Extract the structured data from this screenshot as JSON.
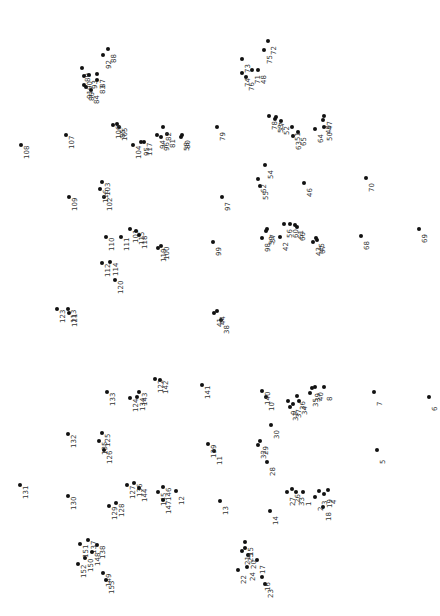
{
  "puzzle": {
    "title": "Connect the dots",
    "dot_color": "#111111",
    "label_color": "#333333",
    "label_rotation_deg": -90,
    "dots": [
      {
        "n": 1,
        "x": 303,
        "y": 492
      },
      {
        "n": 2,
        "x": 315,
        "y": 497
      },
      {
        "n": 3,
        "x": 319,
        "y": 491
      },
      {
        "n": 4,
        "x": 328,
        "y": 490
      },
      {
        "n": 5,
        "x": 377,
        "y": 450
      },
      {
        "n": 6,
        "x": 429,
        "y": 397
      },
      {
        "n": 7,
        "x": 374,
        "y": 392
      },
      {
        "n": 8,
        "x": 324,
        "y": 387
      },
      {
        "n": 9,
        "x": 288,
        "y": 401
      },
      {
        "n": 10,
        "x": 266,
        "y": 397
      },
      {
        "n": 11,
        "x": 214,
        "y": 451
      },
      {
        "n": 12,
        "x": 176,
        "y": 491
      },
      {
        "n": 13,
        "x": 220,
        "y": 501
      },
      {
        "n": 14,
        "x": 270,
        "y": 511
      },
      {
        "n": 15,
        "x": 245,
        "y": 542
      },
      {
        "n": 16,
        "x": 262,
        "y": 577
      },
      {
        "n": 17,
        "x": 257,
        "y": 560
      },
      {
        "n": 18,
        "x": 323,
        "y": 507
      },
      {
        "n": 19,
        "x": 324,
        "y": 494
      },
      {
        "n": 20,
        "x": 248,
        "y": 555
      },
      {
        "n": 21,
        "x": 242,
        "y": 551
      },
      {
        "n": 22,
        "x": 238,
        "y": 570
      },
      {
        "n": 23,
        "x": 265,
        "y": 584
      },
      {
        "n": 24,
        "x": 247,
        "y": 567
      },
      {
        "n": 25,
        "x": 245,
        "y": 548
      },
      {
        "n": 26,
        "x": 292,
        "y": 489
      },
      {
        "n": 27,
        "x": 287,
        "y": 492
      },
      {
        "n": 28,
        "x": 267,
        "y": 462
      },
      {
        "n": 29,
        "x": 260,
        "y": 441
      },
      {
        "n": 30,
        "x": 271,
        "y": 425
      },
      {
        "n": 31,
        "x": 290,
        "y": 407
      },
      {
        "n": 32,
        "x": 258,
        "y": 445
      },
      {
        "n": 33,
        "x": 296,
        "y": 492
      },
      {
        "n": 34,
        "x": 299,
        "y": 401
      },
      {
        "n": 35,
        "x": 310,
        "y": 393
      },
      {
        "n": 36,
        "x": 297,
        "y": 396
      },
      {
        "n": 37,
        "x": 293,
        "y": 404
      },
      {
        "n": 38,
        "x": 221,
        "y": 320
      },
      {
        "n": 39,
        "x": 312,
        "y": 388
      },
      {
        "n": 40,
        "x": 315,
        "y": 387
      },
      {
        "n": 41,
        "x": 214,
        "y": 313
      },
      {
        "n": 42,
        "x": 280,
        "y": 237
      },
      {
        "n": 43,
        "x": 313,
        "y": 242
      },
      {
        "n": 44,
        "x": 217,
        "y": 311
      },
      {
        "n": 45,
        "x": 316,
        "y": 238
      },
      {
        "n": 46,
        "x": 304,
        "y": 183
      },
      {
        "n": 47,
        "x": 324,
        "y": 116
      },
      {
        "n": 48,
        "x": 258,
        "y": 70
      },
      {
        "n": 49,
        "x": 323,
        "y": 120
      },
      {
        "n": 50,
        "x": 324,
        "y": 127
      },
      {
        "n": 51,
        "x": 292,
        "y": 127
      },
      {
        "n": 52,
        "x": 281,
        "y": 121
      },
      {
        "n": 53,
        "x": 275,
        "y": 119
      },
      {
        "n": 54,
        "x": 265,
        "y": 165
      },
      {
        "n": 55,
        "x": 260,
        "y": 186
      },
      {
        "n": 56,
        "x": 284,
        "y": 224
      },
      {
        "n": 57,
        "x": 267,
        "y": 229
      },
      {
        "n": 58,
        "x": 181,
        "y": 137
      },
      {
        "n": 59,
        "x": 266,
        "y": 231
      },
      {
        "n": 60,
        "x": 290,
        "y": 224
      },
      {
        "n": 61,
        "x": 295,
        "y": 225
      },
      {
        "n": 62,
        "x": 258,
        "y": 179
      },
      {
        "n": 63,
        "x": 293,
        "y": 136
      },
      {
        "n": 64,
        "x": 315,
        "y": 129
      },
      {
        "n": 65,
        "x": 298,
        "y": 132
      },
      {
        "n": 66,
        "x": 297,
        "y": 227
      },
      {
        "n": 67,
        "x": 317,
        "y": 240
      },
      {
        "n": 68,
        "x": 361,
        "y": 236
      },
      {
        "n": 69,
        "x": 419,
        "y": 229
      },
      {
        "n": 70,
        "x": 366,
        "y": 178
      },
      {
        "n": 71,
        "x": 252,
        "y": 70
      },
      {
        "n": 72,
        "x": 268,
        "y": 41
      },
      {
        "n": 73,
        "x": 242,
        "y": 59
      },
      {
        "n": 74,
        "x": 242,
        "y": 73
      },
      {
        "n": 75,
        "x": 264,
        "y": 50
      },
      {
        "n": 76,
        "x": 246,
        "y": 77
      },
      {
        "n": 77,
        "x": 276,
        "y": 117
      },
      {
        "n": 78,
        "x": 269,
        "y": 116
      },
      {
        "n": 79,
        "x": 217,
        "y": 127
      },
      {
        "n": 80,
        "x": 182,
        "y": 135
      },
      {
        "n": 81,
        "x": 167,
        "y": 134
      },
      {
        "n": 82,
        "x": 163,
        "y": 127
      },
      {
        "n": 83,
        "x": 97,
        "y": 80
      },
      {
        "n": 84,
        "x": 91,
        "y": 90
      },
      {
        "n": 85,
        "x": 117,
        "y": 124
      },
      {
        "n": 86,
        "x": 86,
        "y": 87
      },
      {
        "n": 87,
        "x": 97,
        "y": 74
      },
      {
        "n": 88,
        "x": 108,
        "y": 49
      },
      {
        "n": 89,
        "x": 82,
        "y": 68
      },
      {
        "n": 90,
        "x": 84,
        "y": 76
      },
      {
        "n": 91,
        "x": 84,
        "y": 85
      },
      {
        "n": 92,
        "x": 103,
        "y": 55
      },
      {
        "n": 93,
        "x": 89,
        "y": 75
      },
      {
        "n": 94,
        "x": 157,
        "y": 135
      },
      {
        "n": 95,
        "x": 141,
        "y": 142
      },
      {
        "n": 96,
        "x": 161,
        "y": 137
      },
      {
        "n": 97,
        "x": 222,
        "y": 197
      },
      {
        "n": 98,
        "x": 262,
        "y": 238
      },
      {
        "n": 99,
        "x": 213,
        "y": 242
      },
      {
        "n": 100,
        "x": 161,
        "y": 246
      },
      {
        "n": 101,
        "x": 130,
        "y": 229
      },
      {
        "n": 102,
        "x": 104,
        "y": 197
      },
      {
        "n": 103,
        "x": 102,
        "y": 182
      },
      {
        "n": 104,
        "x": 133,
        "y": 145
      },
      {
        "n": 105,
        "x": 119,
        "y": 127
      },
      {
        "n": 106,
        "x": 113,
        "y": 125
      },
      {
        "n": 107,
        "x": 66,
        "y": 135
      },
      {
        "n": 108,
        "x": 21,
        "y": 145
      },
      {
        "n": 109,
        "x": 69,
        "y": 197
      },
      {
        "n": 110,
        "x": 106,
        "y": 237
      },
      {
        "n": 111,
        "x": 121,
        "y": 237
      },
      {
        "n": 112,
        "x": 102,
        "y": 263
      },
      {
        "n": 113,
        "x": 68,
        "y": 309
      },
      {
        "n": 114,
        "x": 110,
        "y": 262
      },
      {
        "n": 115,
        "x": 136,
        "y": 231
      },
      {
        "n": 116,
        "x": 100,
        "y": 189
      },
      {
        "n": 117,
        "x": 144,
        "y": 142
      },
      {
        "n": 118,
        "x": 139,
        "y": 235
      },
      {
        "n": 119,
        "x": 158,
        "y": 248
      },
      {
        "n": 120,
        "x": 115,
        "y": 280
      },
      {
        "n": 121,
        "x": 69,
        "y": 313
      },
      {
        "n": 122,
        "x": 155,
        "y": 379
      },
      {
        "n": 123,
        "x": 57,
        "y": 309
      },
      {
        "n": 124,
        "x": 130,
        "y": 398
      },
      {
        "n": 125,
        "x": 102,
        "y": 433
      },
      {
        "n": 126,
        "x": 104,
        "y": 450
      },
      {
        "n": 127,
        "x": 127,
        "y": 485
      },
      {
        "n": 128,
        "x": 116,
        "y": 503
      },
      {
        "n": 129,
        "x": 109,
        "y": 506
      },
      {
        "n": 130,
        "x": 68,
        "y": 496
      },
      {
        "n": 131,
        "x": 20,
        "y": 485
      },
      {
        "n": 132,
        "x": 68,
        "y": 434
      },
      {
        "n": 133,
        "x": 107,
        "y": 392
      },
      {
        "n": 134,
        "x": 137,
        "y": 397
      },
      {
        "n": 135,
        "x": 99,
        "y": 441
      },
      {
        "n": 136,
        "x": 134,
        "y": 483
      },
      {
        "n": 137,
        "x": 88,
        "y": 540
      },
      {
        "n": 138,
        "x": 97,
        "y": 545
      },
      {
        "n": 139,
        "x": 208,
        "y": 444
      },
      {
        "n": 140,
        "x": 262,
        "y": 391
      },
      {
        "n": 141,
        "x": 202,
        "y": 385
      },
      {
        "n": 142,
        "x": 160,
        "y": 380
      },
      {
        "n": 143,
        "x": 139,
        "y": 392
      },
      {
        "n": 144,
        "x": 139,
        "y": 488
      },
      {
        "n": 145,
        "x": 158,
        "y": 492
      },
      {
        "n": 146,
        "x": 163,
        "y": 487
      },
      {
        "n": 147,
        "x": 163,
        "y": 500
      },
      {
        "n": 148,
        "x": 92,
        "y": 552
      },
      {
        "n": 149,
        "x": 103,
        "y": 573
      },
      {
        "n": 150,
        "x": 85,
        "y": 558
      },
      {
        "n": 151,
        "x": 80,
        "y": 544
      },
      {
        "n": 152,
        "x": 78,
        "y": 564
      },
      {
        "n": 153,
        "x": 106,
        "y": 580
      }
    ]
  }
}
